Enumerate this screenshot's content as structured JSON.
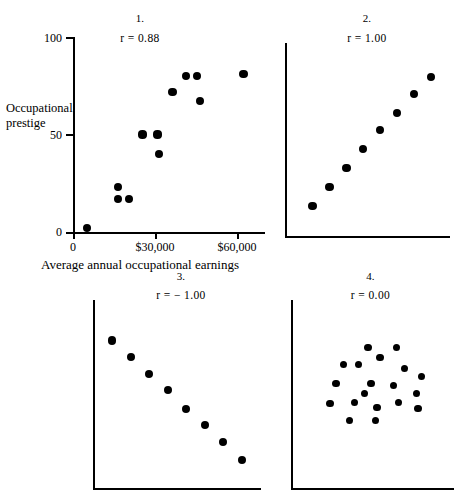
{
  "figure": {
    "background_color": "#ffffff",
    "ink_color": "#000000",
    "width": 457,
    "height": 498
  },
  "chart_data": [
    {
      "type": "scatter",
      "title": "1.",
      "annotation": "r  =  0.88",
      "correlation": 0.88,
      "xlabel": "Average annual occupational earnings",
      "ylabel_line1": "Occupational",
      "ylabel_line2": "prestige",
      "ylabel": "Occupational prestige",
      "xlim": [
        0,
        70000
      ],
      "ylim": [
        0,
        100
      ],
      "xticks": [
        0,
        30000,
        60000
      ],
      "xtick_labels": [
        "0",
        "$30,000",
        "$60,000"
      ],
      "yticks": [
        0,
        50,
        100
      ],
      "ytick_labels": [
        "0",
        "50",
        "100"
      ],
      "grid": false,
      "legend": "none",
      "x": [
        5000,
        16500,
        16500,
        20500,
        25500,
        31000,
        31500,
        36500,
        41500,
        45500,
        46500,
        62500
      ],
      "y": [
        2,
        23,
        17,
        17,
        50,
        50,
        40,
        72,
        80,
        80,
        67,
        81
      ]
    },
    {
      "type": "scatter",
      "title": "2.",
      "annotation": "r  =  1.00",
      "correlation": 1.0,
      "xlabel": "",
      "ylabel": "",
      "xlim": [
        0,
        100
      ],
      "ylim": [
        0,
        100
      ],
      "grid": false,
      "legend": "none",
      "x": [
        14,
        25,
        36,
        47,
        58,
        69,
        80,
        91
      ],
      "y": [
        14,
        25,
        36,
        47,
        58,
        68,
        79,
        89
      ]
    },
    {
      "type": "scatter",
      "title": "3.",
      "annotation": "r  =  − 1.00",
      "correlation": -1.0,
      "xlabel": "",
      "ylabel": "",
      "xlim": [
        0,
        100
      ],
      "ylim": [
        0,
        100
      ],
      "grid": false,
      "legend": "none",
      "x": [
        8,
        20,
        32,
        44,
        56,
        68,
        80,
        92
      ],
      "y": [
        84,
        74,
        64,
        54,
        43,
        33,
        23,
        12
      ]
    },
    {
      "type": "scatter",
      "title": "4.",
      "annotation": "r  =  0.00",
      "correlation": 0.0,
      "xlabel": "",
      "ylabel": "",
      "xlim": [
        0,
        100
      ],
      "ylim": [
        0,
        100
      ],
      "grid": false,
      "legend": "none",
      "x": [
        46,
        65,
        30,
        40,
        54,
        70,
        81,
        25,
        48,
        63,
        78,
        21,
        37,
        52,
        66,
        79,
        34,
        51,
        44
      ],
      "y": [
        79,
        79,
        69,
        69,
        73,
        67,
        62,
        58,
        58,
        57,
        52,
        46,
        47,
        44,
        47,
        43,
        36,
        36,
        52
      ]
    }
  ]
}
